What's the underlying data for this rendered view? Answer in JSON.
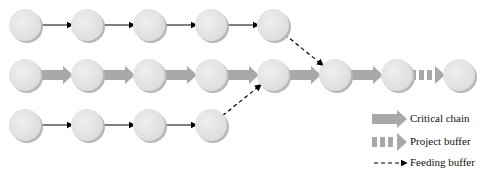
{
  "diagram": {
    "rows": [
      {
        "name": "feeding-chain-top",
        "y": 25,
        "nodes_x": [
          25,
          87,
          149,
          211,
          273
        ],
        "link": "thin-arrow"
      },
      {
        "name": "critical-chain",
        "y": 75,
        "nodes_x": [
          25,
          87,
          149,
          211,
          273,
          335,
          397,
          459
        ],
        "link": "thick-arrow"
      },
      {
        "name": "feeding-chain-bottom",
        "y": 125,
        "nodes_x": [
          25,
          87,
          149,
          211
        ],
        "link": "thin-arrow"
      }
    ],
    "feeding_buffers": [
      {
        "from": [
          273,
          25
        ],
        "to": [
          335,
          75
        ]
      },
      {
        "from": [
          211,
          125
        ],
        "to": [
          273,
          75
        ]
      }
    ],
    "project_buffer": {
      "from_node_x": 397,
      "to_node_x": 459
    },
    "colors": {
      "node_fill": "#e4e4e4",
      "node_shadow": "#b8b8b8",
      "thick_arrow": "#a8a8a8",
      "thin_arrow": "#000000"
    }
  },
  "legend": {
    "items": [
      {
        "label": "Critical chain",
        "icon": "thick-arrow-icon"
      },
      {
        "label": "Project buffer",
        "icon": "dashed-thick-arrow-icon"
      },
      {
        "label": "Feeding buffer",
        "icon": "dashed-thin-arrow-icon"
      }
    ]
  }
}
